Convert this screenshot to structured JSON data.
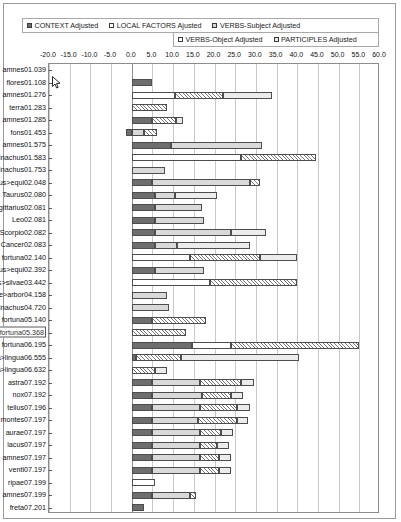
{
  "legend": {
    "row1": [
      {
        "label": "CONTEXT Adjusted",
        "swatch": "sw-context",
        "icon": "filled-square-icon"
      },
      {
        "label": "LOCAL FACTORS Ajusted",
        "swatch": "sw-local",
        "icon": "empty-square-icon"
      },
      {
        "label": "VERBS-Subject Adjusted",
        "swatch": "sw-vsubj",
        "icon": "gray-square-icon"
      }
    ],
    "row2": [
      {
        "label": "VERBS-Object Adjusted",
        "swatch": "sw-vobj",
        "icon": "hatched-square-icon"
      },
      {
        "label": "PARTICIPLES Adjusted",
        "swatch": "sw-part",
        "icon": "light-square-icon"
      }
    ]
  },
  "chart_data": {
    "type": "bar",
    "orientation": "horizontal",
    "stacked": true,
    "title": "",
    "xlabel": "",
    "ylabel": "",
    "xlim": [
      -20.0,
      60.0
    ],
    "xticks": [
      "-20.0",
      "-15.0",
      "-10.0",
      "-5.0",
      "0.0",
      "5.0",
      "10.0",
      "15.0",
      "20.0",
      "25.0",
      "30.0",
      "35.0",
      "40.0",
      "45.0",
      "50.0",
      "55.0",
      "60.0"
    ],
    "xtick_values": [
      -20,
      -15,
      -10,
      -5,
      0,
      5,
      10,
      15,
      20,
      25,
      30,
      35,
      40,
      45,
      50,
      55,
      60
    ],
    "grid": true,
    "legend_position": "top",
    "series": [
      {
        "name": "CONTEXT Adjusted",
        "key": "context",
        "color": "#6e6e6e"
      },
      {
        "name": "LOCAL FACTORS Ajusted",
        "key": "local",
        "color": "#ffffff"
      },
      {
        "name": "VERBS-Subject Adjusted",
        "key": "vsubj",
        "color": "#d9d9d9"
      },
      {
        "name": "VERBS-Object Adjusted",
        "key": "vobj",
        "color": "#ffffff"
      },
      {
        "name": "PARTICIPLES Adjusted",
        "key": "part",
        "color": "#ececec"
      }
    ],
    "categories": [
      "amnes01.039",
      "flores01.108",
      "amnes01.276",
      "terra01.283",
      "amnes01.285",
      "fons01.453",
      "amnes01.575",
      "Inachus01.583",
      "Inachus01.753",
      "Phoebus>equi02.048",
      "Taurus02.080",
      "Sagittarius02.081",
      "Leo02.081",
      "Scorpio02.082",
      "Cancer02.083",
      "fortuna02.140",
      "Phoebus>equi02.392",
      "Narcissus>silvae03.442",
      "Pyramus&Thisbe>arbor04.158",
      "Inachus04.720",
      "fortuna05.140",
      "fortuna05.368",
      "fortuna06.195",
      "Philomela>lingua06.555",
      "Philomela>lingua06.632",
      "astra07.192",
      "nox07.192",
      "tellus07.196",
      "montes07.197",
      "aurae07.197",
      "lacus07.197",
      "amnes07.197",
      "venti07.197",
      "ripae07.199",
      "amnes07.199",
      "freta07.201"
    ],
    "selected_category": "fortuna05.368",
    "rows": [
      {
        "category": "amnes01.039",
        "context": 0.0,
        "local": 0.0,
        "vsubj": 0.0,
        "vobj": 0.0,
        "part": 0.0,
        "total": 0.0
      },
      {
        "category": "flores01.108",
        "context": 5.0,
        "local": 0.0,
        "vsubj": 0.0,
        "vobj": 0.0,
        "part": 0.0,
        "total": 5.0
      },
      {
        "category": "amnes01.276",
        "context": 0.0,
        "local": 10.5,
        "vsubj": 0.0,
        "vobj": 11.5,
        "part": 12.0,
        "total": 34.0
      },
      {
        "category": "terra01.283",
        "context": 0.0,
        "local": 0.0,
        "vsubj": 0.0,
        "vobj": 8.5,
        "part": 0.0,
        "total": 8.5
      },
      {
        "category": "amnes01.285",
        "context": 4.8,
        "local": 0.0,
        "vsubj": 0.0,
        "vobj": 6.0,
        "part": 1.5,
        "total": 12.3
      },
      {
        "category": "fons01.453",
        "context": -1.5,
        "local": 0.0,
        "vsubj": 3.0,
        "vobj": 3.0,
        "part": 0.0,
        "total": 4.5
      },
      {
        "category": "amnes01.575",
        "context": 9.5,
        "local": 0.0,
        "vsubj": 22.0,
        "vobj": 0.0,
        "part": 0.0,
        "total": 31.5
      },
      {
        "category": "Inachus01.583",
        "context": 0.0,
        "local": 26.5,
        "vsubj": 0.0,
        "vobj": 18.0,
        "part": 0.0,
        "total": 44.5
      },
      {
        "category": "Inachus01.753",
        "context": 0.0,
        "local": 0.0,
        "vsubj": 8.0,
        "vobj": 0.0,
        "part": 0.0,
        "total": 8.0
      },
      {
        "category": "Phoebus>equi02.048",
        "context": 5.0,
        "local": 0.0,
        "vsubj": 23.5,
        "vobj": 2.5,
        "part": 0.0,
        "total": 31.0
      },
      {
        "category": "Taurus02.080",
        "context": 5.5,
        "local": 0.0,
        "vsubj": 5.0,
        "vobj": 0.0,
        "part": 10.0,
        "total": 20.5
      },
      {
        "category": "Sagittarius02.081",
        "context": 5.5,
        "local": 0.0,
        "vsubj": 11.5,
        "vobj": 0.0,
        "part": 0.0,
        "total": 17.0
      },
      {
        "category": "Leo02.081",
        "context": 5.5,
        "local": 0.0,
        "vsubj": 12.0,
        "vobj": 0.0,
        "part": 0.0,
        "total": 17.5
      },
      {
        "category": "Scorpio02.082",
        "context": 5.5,
        "local": 0.0,
        "vsubj": 18.5,
        "vobj": 0.0,
        "part": 8.5,
        "total": 32.5
      },
      {
        "category": "Cancer02.083",
        "context": 5.5,
        "local": 0.0,
        "vsubj": 5.5,
        "vobj": 0.0,
        "part": 17.5,
        "total": 28.5
      },
      {
        "category": "fortuna02.140",
        "context": 0.0,
        "local": 14.0,
        "vsubj": 0.0,
        "vobj": 17.0,
        "part": 9.0,
        "total": 40.0
      },
      {
        "category": "Phoebus>equi02.392",
        "context": 5.5,
        "local": 0.0,
        "vsubj": 12.0,
        "vobj": 0.0,
        "part": 0.0,
        "total": 17.5
      },
      {
        "category": "Narcissus>silvae03.442",
        "context": 0.0,
        "local": 19.0,
        "vsubj": 0.0,
        "vobj": 21.0,
        "part": 0.0,
        "total": 40.0
      },
      {
        "category": "Pyramus&Thisbe>arbor04.158",
        "context": 0.0,
        "local": 0.0,
        "vsubj": 8.5,
        "vobj": 0.0,
        "part": 0.0,
        "total": 8.5
      },
      {
        "category": "Inachus04.720",
        "context": 0.0,
        "local": 0.0,
        "vsubj": 9.0,
        "vobj": 0.0,
        "part": 0.0,
        "total": 9.0
      },
      {
        "category": "fortuna05.140",
        "context": 5.0,
        "local": 0.0,
        "vsubj": 0.0,
        "vobj": 13.0,
        "part": 0.0,
        "total": 18.0
      },
      {
        "category": "fortuna05.368",
        "context": 0.0,
        "local": 0.0,
        "vsubj": 0.0,
        "vobj": 13.0,
        "part": 0.0,
        "total": 13.0
      },
      {
        "category": "fortuna06.195",
        "context": 14.5,
        "local": 9.5,
        "vsubj": 0.0,
        "vobj": 31.0,
        "part": 0.0,
        "total": 55.0
      },
      {
        "category": "Philomela>lingua06.555",
        "context": 1.0,
        "local": 0.0,
        "vsubj": 0.0,
        "vobj": 11.0,
        "part": 28.5,
        "total": 40.5
      },
      {
        "category": "Philomela>lingua06.632",
        "context": 0.0,
        "local": 0.0,
        "vsubj": 0.0,
        "vobj": 5.5,
        "part": 3.0,
        "total": 8.5
      },
      {
        "category": "astra07.192",
        "context": 5.0,
        "local": 0.0,
        "vsubj": 11.5,
        "vobj": 10.0,
        "part": 3.0,
        "total": 29.5
      },
      {
        "category": "nox07.192",
        "context": 5.0,
        "local": 0.0,
        "vsubj": 12.0,
        "vobj": 7.0,
        "part": 3.0,
        "total": 27.0
      },
      {
        "category": "tellus07.196",
        "context": 5.0,
        "local": 0.0,
        "vsubj": 11.5,
        "vobj": 9.0,
        "part": 3.0,
        "total": 28.5
      },
      {
        "category": "montes07.197",
        "context": 5.0,
        "local": 0.0,
        "vsubj": 11.0,
        "vobj": 9.5,
        "part": 2.5,
        "total": 28.0
      },
      {
        "category": "aurae07.197",
        "context": 5.0,
        "local": 0.0,
        "vsubj": 11.5,
        "vobj": 5.0,
        "part": 3.0,
        "total": 24.5
      },
      {
        "category": "lacus07.197",
        "context": 5.0,
        "local": 0.0,
        "vsubj": 11.5,
        "vobj": 4.0,
        "part": 3.0,
        "total": 23.5
      },
      {
        "category": "amnes07.197",
        "context": 5.0,
        "local": 0.0,
        "vsubj": 11.5,
        "vobj": 4.5,
        "part": 3.0,
        "total": 24.0
      },
      {
        "category": "venti07.197",
        "context": 5.0,
        "local": 0.0,
        "vsubj": 11.5,
        "vobj": 4.5,
        "part": 3.0,
        "total": 24.0
      },
      {
        "category": "ripae07.199",
        "context": 0.0,
        "local": 5.5,
        "vsubj": 0.0,
        "vobj": 0.0,
        "part": 0.0,
        "total": 5.5
      },
      {
        "category": "amnes07.199",
        "context": 5.0,
        "local": 0.0,
        "vsubj": 9.0,
        "vobj": 1.5,
        "part": 0.0,
        "total": 15.5
      },
      {
        "category": "freta07.201",
        "context": 3.0,
        "local": 0.0,
        "vsubj": 0.0,
        "vobj": 0.0,
        "part": 0.0,
        "total": 3.0
      }
    ]
  },
  "cursor": {
    "icon": "mouse-pointer-icon",
    "x": 52,
    "y": 76
  }
}
